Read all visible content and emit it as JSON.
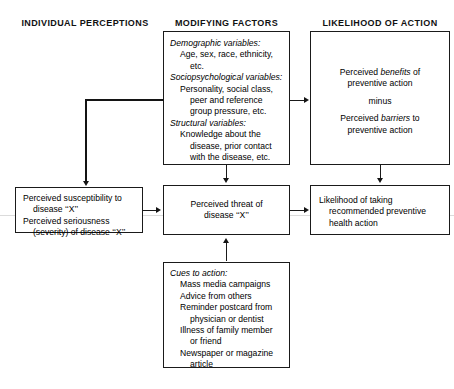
{
  "diagram": {
    "headers": [
      {
        "label": "INDIVIDUAL PERCEPTIONS"
      },
      {
        "label": "MODIFYING FACTORS"
      },
      {
        "label": "LIKELIHOOD OF ACTION"
      }
    ],
    "boxes": {
      "modifying_factors": {
        "name": "modifying-factors",
        "lines": [
          {
            "text": "Demographic variables:",
            "style": "italic",
            "indent": 0
          },
          {
            "text": "Age, sex, race, ethnicity,",
            "style": "normal",
            "indent": 1
          },
          {
            "text": "etc.",
            "style": "normal",
            "indent": 2
          },
          {
            "text": "Sociopsychological variables:",
            "style": "italic",
            "indent": 0
          },
          {
            "text": "Personality, social class,",
            "style": "normal",
            "indent": 1
          },
          {
            "text": "peer and reference",
            "style": "normal",
            "indent": 2
          },
          {
            "text": "group pressure, etc.",
            "style": "normal",
            "indent": 2
          },
          {
            "text": "Structural variables:",
            "style": "italic",
            "indent": 0
          },
          {
            "text": "Knowledge about the",
            "style": "normal",
            "indent": 1
          },
          {
            "text": "disease, prior contact",
            "style": "normal",
            "indent": 2
          },
          {
            "text": "with the disease, etc.",
            "style": "normal",
            "indent": 2
          }
        ]
      },
      "benefits_barriers": {
        "name": "perceived-benefits-barriers",
        "lines": [
          {
            "text": "Perceived benefits of",
            "emph": "benefits"
          },
          {
            "text": "preventive action"
          },
          {
            "text": "minus"
          },
          {
            "text": "Perceived barriers to",
            "emph": "barriers"
          },
          {
            "text": "preventive action"
          }
        ]
      },
      "susceptibility": {
        "name": "perceived-susceptibility-seriousness",
        "lines": [
          {
            "text": "Perceived susceptibility to",
            "indent": 0
          },
          {
            "text": "disease ‘‘X’’",
            "indent": 1
          },
          {
            "text": "Perceived seriousness",
            "indent": 0
          },
          {
            "text": "(severity) of disease ‘‘X’’",
            "indent": 1
          }
        ]
      },
      "threat": {
        "name": "perceived-threat",
        "lines": [
          {
            "text": "Perceived threat of"
          },
          {
            "text": "disease ‘‘X’’"
          }
        ]
      },
      "likelihood": {
        "name": "likelihood-of-taking-action",
        "lines": [
          {
            "text": "Likelihood of taking",
            "indent": 0
          },
          {
            "text": "recommended preventive",
            "indent": 1
          },
          {
            "text": "health action",
            "indent": 1
          }
        ]
      },
      "cues_to_action": {
        "name": "cues-to-action",
        "lines": [
          {
            "text": "Cues to action:",
            "style": "italic",
            "indent": 0
          },
          {
            "text": "Mass media campaigns",
            "style": "normal",
            "indent": 1
          },
          {
            "text": "Advice from others",
            "style": "normal",
            "indent": 1
          },
          {
            "text": "Reminder postcard from",
            "style": "normal",
            "indent": 1
          },
          {
            "text": "physician or dentist",
            "style": "normal",
            "indent": 2
          },
          {
            "text": "Illness of family member",
            "style": "normal",
            "indent": 1
          },
          {
            "text": "or friend",
            "style": "normal",
            "indent": 2
          },
          {
            "text": "Newspaper or magazine",
            "style": "normal",
            "indent": 1
          },
          {
            "text": "article",
            "style": "normal",
            "indent": 2
          }
        ]
      }
    },
    "colors": {
      "stroke": "#1a1a1a",
      "background": "#ffffff",
      "text": "#000000",
      "scanline": "#cfcfcf"
    }
  }
}
